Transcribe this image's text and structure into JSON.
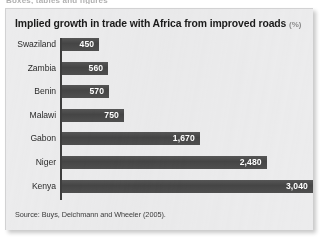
{
  "clipped_header": "Boxes, tables and figures",
  "figure": {
    "title": "Implied growth in trade with Africa from improved roads",
    "title_unit": "(%)",
    "source_note": "Source: Buys, Deichmann and Wheeler (2005)."
  },
  "colors": {
    "panel_background": "#ececed",
    "bar_fill": "#4a4a4a",
    "axis_line": "#3d3d3d",
    "title_text": "#1b1b1b",
    "unit_text": "#8c8c8c",
    "value_label_text": "#ffffff",
    "category_label_text": "#2b2b2b",
    "source_text": "#3a3a3a",
    "page_background": "#ffffff"
  },
  "chart_data": {
    "type": "bar",
    "orientation": "horizontal",
    "title": "Implied growth in trade with Africa from improved roads",
    "subtitle": "(%)",
    "xlabel": "",
    "ylabel": "",
    "categories": [
      "Swaziland",
      "Zambia",
      "Benin",
      "Malawi",
      "Gabon",
      "Niger",
      "Kenya"
    ],
    "values": [
      450,
      560,
      570,
      750,
      1670,
      2480,
      3040
    ],
    "value_labels": [
      "450",
      "560",
      "570",
      "750",
      "1,670",
      "2,480",
      "3,040"
    ],
    "xlim": [
      0,
      3040
    ],
    "grid": false,
    "legend": false,
    "axis_ticks": false,
    "value_labels_inside_bars": true,
    "source": "Buys, Deichmann and Wheeler (2005)."
  }
}
